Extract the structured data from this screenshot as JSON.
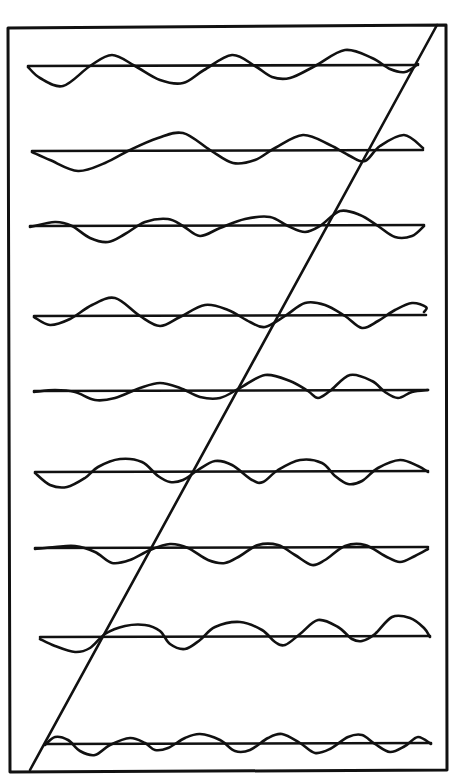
{
  "figure": {
    "ink_color": "#111111",
    "background_color": "#ffffff",
    "frame": {
      "x1": 8,
      "y1": 28,
      "x2": 446,
      "y2": 25,
      "x3": 447,
      "y3": 770,
      "x4": 10,
      "y4": 772
    },
    "diagonal": {
      "x1": 437,
      "y1": 25,
      "x2": 30,
      "y2": 770
    },
    "rows": [
      {
        "y": 66,
        "x_start": 28,
        "x_end": 418,
        "points": [
          [
            28,
            67
          ],
          [
            40,
            78
          ],
          [
            63,
            86
          ],
          [
            90,
            66
          ],
          [
            112,
            55
          ],
          [
            135,
            66
          ],
          [
            160,
            80
          ],
          [
            183,
            83
          ],
          [
            204,
            70
          ],
          [
            232,
            55
          ],
          [
            255,
            66
          ],
          [
            272,
            77
          ],
          [
            290,
            78
          ],
          [
            315,
            66
          ],
          [
            345,
            50
          ],
          [
            372,
            58
          ],
          [
            390,
            69
          ],
          [
            405,
            72
          ],
          [
            418,
            64
          ]
        ]
      },
      {
        "y": 151,
        "x_start": 32,
        "x_end": 423,
        "points": [
          [
            32,
            152
          ],
          [
            50,
            160
          ],
          [
            78,
            171
          ],
          [
            105,
            163
          ],
          [
            130,
            150
          ],
          [
            158,
            138
          ],
          [
            183,
            133
          ],
          [
            210,
            150
          ],
          [
            233,
            163
          ],
          [
            255,
            160
          ],
          [
            275,
            148
          ],
          [
            303,
            135
          ],
          [
            330,
            145
          ],
          [
            350,
            156
          ],
          [
            365,
            161
          ],
          [
            380,
            146
          ],
          [
            404,
            135
          ],
          [
            423,
            148
          ]
        ]
      },
      {
        "y": 226,
        "x_start": 30,
        "x_end": 424,
        "points": [
          [
            30,
            227
          ],
          [
            55,
            222
          ],
          [
            72,
            226
          ],
          [
            90,
            238
          ],
          [
            108,
            242
          ],
          [
            125,
            234
          ],
          [
            145,
            222
          ],
          [
            168,
            219
          ],
          [
            183,
            226
          ],
          [
            200,
            236
          ],
          [
            220,
            228
          ],
          [
            245,
            219
          ],
          [
            270,
            217
          ],
          [
            288,
            226
          ],
          [
            305,
            232
          ],
          [
            320,
            226
          ],
          [
            340,
            211
          ],
          [
            360,
            215
          ],
          [
            378,
            226
          ],
          [
            395,
            237
          ],
          [
            412,
            236
          ],
          [
            424,
            226
          ]
        ]
      },
      {
        "y": 316,
        "x_start": 34,
        "x_end": 426,
        "points": [
          [
            34,
            317
          ],
          [
            50,
            325
          ],
          [
            70,
            319
          ],
          [
            92,
            305
          ],
          [
            115,
            298
          ],
          [
            140,
            316
          ],
          [
            160,
            326
          ],
          [
            180,
            317
          ],
          [
            205,
            305
          ],
          [
            228,
            310
          ],
          [
            250,
            322
          ],
          [
            265,
            327
          ],
          [
            285,
            316
          ],
          [
            305,
            303
          ],
          [
            325,
            305
          ],
          [
            345,
            316
          ],
          [
            362,
            328
          ],
          [
            378,
            321
          ],
          [
            395,
            310
          ],
          [
            412,
            303
          ],
          [
            426,
            307
          ],
          [
            424,
            312
          ]
        ]
      },
      {
        "y": 391,
        "x_start": 34,
        "x_end": 428,
        "points": [
          [
            34,
            392
          ],
          [
            55,
            390
          ],
          [
            75,
            392
          ],
          [
            95,
            400
          ],
          [
            115,
            398
          ],
          [
            140,
            388
          ],
          [
            160,
            383
          ],
          [
            180,
            388
          ],
          [
            200,
            397
          ],
          [
            220,
            398
          ],
          [
            240,
            388
          ],
          [
            265,
            375
          ],
          [
            290,
            381
          ],
          [
            308,
            391
          ],
          [
            318,
            398
          ],
          [
            330,
            391
          ],
          [
            350,
            375
          ],
          [
            372,
            381
          ],
          [
            385,
            392
          ],
          [
            398,
            398
          ],
          [
            412,
            392
          ],
          [
            428,
            390
          ]
        ]
      },
      {
        "y": 472,
        "x_start": 35,
        "x_end": 428,
        "points": [
          [
            35,
            473
          ],
          [
            50,
            485
          ],
          [
            67,
            487
          ],
          [
            85,
            478
          ],
          [
            98,
            467
          ],
          [
            120,
            459
          ],
          [
            142,
            462
          ],
          [
            158,
            476
          ],
          [
            170,
            482
          ],
          [
            183,
            480
          ],
          [
            198,
            470
          ],
          [
            215,
            461
          ],
          [
            232,
            465
          ],
          [
            252,
            480
          ],
          [
            263,
            482
          ],
          [
            278,
            470
          ],
          [
            300,
            460
          ],
          [
            322,
            463
          ],
          [
            335,
            476
          ],
          [
            348,
            484
          ],
          [
            362,
            481
          ],
          [
            378,
            468
          ],
          [
            400,
            460
          ],
          [
            418,
            466
          ],
          [
            428,
            472
          ]
        ]
      },
      {
        "y": 548,
        "x_start": 35,
        "x_end": 428,
        "points": [
          [
            35,
            549
          ],
          [
            55,
            547
          ],
          [
            75,
            546
          ],
          [
            95,
            552
          ],
          [
            112,
            563
          ],
          [
            130,
            560
          ],
          [
            150,
            550
          ],
          [
            170,
            544
          ],
          [
            188,
            548
          ],
          [
            208,
            560
          ],
          [
            225,
            563
          ],
          [
            240,
            556
          ],
          [
            258,
            545
          ],
          [
            278,
            545
          ],
          [
            295,
            555
          ],
          [
            312,
            565
          ],
          [
            325,
            560
          ],
          [
            345,
            546
          ],
          [
            365,
            545
          ],
          [
            385,
            556
          ],
          [
            400,
            562
          ],
          [
            415,
            556
          ],
          [
            428,
            549
          ]
        ]
      },
      {
        "y": 637,
        "x_start": 40,
        "x_end": 430,
        "points": [
          [
            40,
            639
          ],
          [
            55,
            646
          ],
          [
            75,
            652
          ],
          [
            90,
            648
          ],
          [
            105,
            634
          ],
          [
            125,
            626
          ],
          [
            145,
            625
          ],
          [
            160,
            631
          ],
          [
            170,
            644
          ],
          [
            185,
            649
          ],
          [
            200,
            640
          ],
          [
            215,
            627
          ],
          [
            240,
            622
          ],
          [
            262,
            630
          ],
          [
            275,
            642
          ],
          [
            285,
            645
          ],
          [
            300,
            634
          ],
          [
            318,
            620
          ],
          [
            338,
            627
          ],
          [
            352,
            639
          ],
          [
            362,
            641
          ],
          [
            375,
            634
          ],
          [
            392,
            617
          ],
          [
            410,
            618
          ],
          [
            424,
            628
          ],
          [
            430,
            637
          ]
        ]
      },
      {
        "y": 744,
        "x_start": 45,
        "x_end": 431,
        "points": [
          [
            45,
            745
          ],
          [
            55,
            737
          ],
          [
            68,
            740
          ],
          [
            80,
            751
          ],
          [
            95,
            755
          ],
          [
            110,
            745
          ],
          [
            130,
            738
          ],
          [
            145,
            743
          ],
          [
            155,
            750
          ],
          [
            168,
            748
          ],
          [
            185,
            738
          ],
          [
            200,
            734
          ],
          [
            220,
            740
          ],
          [
            235,
            751
          ],
          [
            250,
            750
          ],
          [
            268,
            738
          ],
          [
            282,
            734
          ],
          [
            300,
            743
          ],
          [
            315,
            753
          ],
          [
            330,
            749
          ],
          [
            348,
            737
          ],
          [
            362,
            735
          ],
          [
            375,
            744
          ],
          [
            390,
            752
          ],
          [
            405,
            746
          ],
          [
            418,
            737
          ],
          [
            431,
            744
          ]
        ]
      }
    ]
  }
}
